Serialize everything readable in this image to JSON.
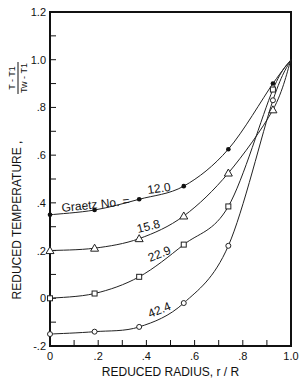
{
  "chart_data": {
    "type": "line",
    "title": "",
    "xlabel": "REDUCED RADIUS,   r / R",
    "ylabel": "REDUCED TEMPERATURE ,",
    "ylabel_fraction": {
      "numerator": "T - T1",
      "denominator": "Tw - T1"
    },
    "xlim": [
      0,
      1.0
    ],
    "ylim": [
      -0.2,
      1.2
    ],
    "x_ticks": [
      0,
      0.2,
      0.4,
      0.6,
      0.8,
      1.0
    ],
    "x_tick_labels": [
      "0",
      ".2",
      ".4",
      ".6",
      ".8",
      "1.0"
    ],
    "y_ticks": [
      -0.2,
      0,
      0.2,
      0.4,
      0.6,
      0.8,
      1.0,
      1.2
    ],
    "y_tick_labels": [
      "-.2",
      "0",
      ".2",
      ".4",
      ".6",
      ".8",
      "1.0",
      "1.2"
    ],
    "grid": false,
    "annotation": "Graetz No. =",
    "series": [
      {
        "name": "12.0",
        "marker": "filled-circle",
        "x": [
          0,
          0.185,
          0.37,
          0.555,
          0.74,
          0.925,
          1.0
        ],
        "y": [
          0.35,
          0.37,
          0.415,
          0.47,
          0.625,
          0.9,
          1.0
        ]
      },
      {
        "name": "15.8",
        "marker": "triangle",
        "x": [
          0,
          0.185,
          0.37,
          0.555,
          0.74,
          0.925,
          1.0
        ],
        "y": [
          0.2,
          0.21,
          0.25,
          0.345,
          0.525,
          0.79,
          1.0
        ]
      },
      {
        "name": "22.9",
        "marker": "square",
        "x": [
          0,
          0.185,
          0.37,
          0.555,
          0.74,
          0.925,
          1.0
        ],
        "y": [
          0.0,
          0.02,
          0.09,
          0.225,
          0.385,
          0.875,
          1.0
        ]
      },
      {
        "name": "42.4",
        "marker": "open-circle",
        "x": [
          0,
          0.185,
          0.37,
          0.555,
          0.74,
          0.925,
          1.0
        ],
        "y": [
          -0.15,
          -0.14,
          -0.12,
          -0.02,
          0.22,
          0.83,
          1.0
        ]
      }
    ]
  }
}
